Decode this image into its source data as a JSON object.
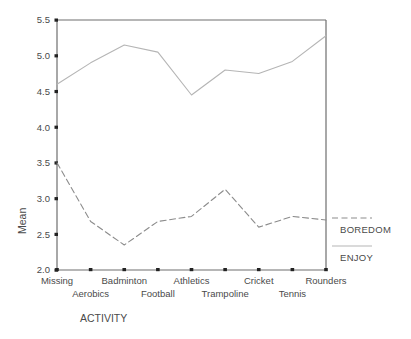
{
  "chart_data": {
    "type": "line",
    "title": "",
    "xlabel": "ACTIVITY",
    "ylabel": "Mean",
    "categories": [
      "Missing",
      "Aerobics",
      "Badminton",
      "Football",
      "Athletics",
      "Trampoline",
      "Cricket",
      "Tennis",
      "Rounders"
    ],
    "ylim": [
      2.0,
      5.5
    ],
    "ytick_labels": [
      "5.5",
      "5.0",
      "4.5",
      "4.0",
      "3.5",
      "3.0",
      "2.5",
      "2.0"
    ],
    "ytick_values": [
      5.5,
      5.0,
      4.5,
      4.0,
      3.5,
      3.0,
      2.5,
      2.0
    ],
    "grid": false,
    "legend_position": "right",
    "series": [
      {
        "name": "BOREDOM",
        "style": "dashed",
        "color": "#8c8c8c",
        "values": [
          3.5,
          2.68,
          2.35,
          2.68,
          2.75,
          3.13,
          2.6,
          2.75,
          2.7
        ]
      },
      {
        "name": "ENJOY",
        "style": "solid",
        "color": "#b5b5b5",
        "values": [
          4.6,
          4.9,
          5.15,
          5.05,
          4.45,
          4.8,
          4.75,
          4.92,
          5.28
        ]
      }
    ]
  },
  "axis": {
    "y_title": "Mean",
    "x_title": "ACTIVITY",
    "ticks": [
      {
        "label": "5.5",
        "value": 5.5
      },
      {
        "label": "5.0",
        "value": 5.0
      },
      {
        "label": "4.5",
        "value": 4.5
      },
      {
        "label": "4.0",
        "value": 4.0
      },
      {
        "label": "3.5",
        "value": 3.5
      },
      {
        "label": "3.0",
        "value": 3.0
      },
      {
        "label": "2.5",
        "value": 2.5
      },
      {
        "label": "2.0",
        "value": 2.0
      }
    ]
  },
  "categories_row_top": [
    "Missing",
    "Badminton",
    "Athletics",
    "Cricket",
    "Rounders"
  ],
  "categories_row_bottom": [
    "Aerobics",
    "Football",
    "Trampoline",
    "Tennis"
  ],
  "legend": {
    "items": [
      {
        "label": "BOREDOM",
        "style": "dashed"
      },
      {
        "label": "ENJOY",
        "style": "solid"
      }
    ]
  }
}
